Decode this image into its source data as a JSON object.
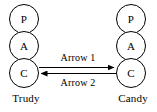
{
  "diagram": {
    "type": "protocol-stack-message-flow",
    "background_color": "#ffffff",
    "stroke_color": "#000000",
    "endpoints": [
      {
        "id": "trudy",
        "name": "Trudy",
        "side": "left",
        "layers": [
          {
            "id": "trudy-p",
            "label": "P"
          },
          {
            "id": "trudy-a",
            "label": "A"
          },
          {
            "id": "trudy-c",
            "label": "C"
          }
        ]
      },
      {
        "id": "candy",
        "name": "Candy",
        "side": "right",
        "layers": [
          {
            "id": "candy-p",
            "label": "P"
          },
          {
            "id": "candy-a",
            "label": "A"
          },
          {
            "id": "candy-c",
            "label": "C"
          }
        ]
      }
    ],
    "arrows": [
      {
        "id": "arrow-1",
        "label": "Arrow 1",
        "direction": "left-to-right",
        "from": "trudy-c",
        "to": "candy-c"
      },
      {
        "id": "arrow-2",
        "label": "Arrow 2",
        "direction": "right-to-left",
        "from": "candy-c",
        "to": "trudy-c"
      }
    ]
  }
}
